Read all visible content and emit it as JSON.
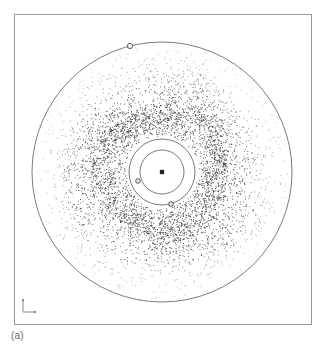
{
  "figure": {
    "caption": "(a)",
    "panel_label": "(a)",
    "background_color": "#ffffff",
    "frame": {
      "x": 14,
      "y": 14,
      "width": 298,
      "height": 311,
      "stroke_color": "#9a9a9a",
      "stroke_width": 1
    },
    "axis_indicator": {
      "name": "orientation-axes",
      "origin_x": 23,
      "origin_y": 312,
      "arm_length": 12,
      "stroke_color": "#8a8a8a",
      "tick_color": "#6a6a6a"
    }
  },
  "chart_data": {
    "type": "scatter",
    "title": "(a)",
    "subtitle": "",
    "xlabel": "",
    "ylabel": "",
    "grid": false,
    "legend_position": "none",
    "axis_ticks_visible": false,
    "center": {
      "x": 162,
      "y": 172
    },
    "xlim": [
      14,
      312
    ],
    "ylim": [
      14,
      325
    ],
    "point_color": "#3c3c3c",
    "point_count": 5200,
    "point_radius_px": 0.45,
    "radial_profile": {
      "inner_void_radius": 36,
      "ring_peak_radius": 68,
      "ring_half_width": 26,
      "outer_cutoff_radius": 132,
      "description": "annular particle disc, dense ring fading outward"
    },
    "circles": [
      {
        "name": "outer-boundary-circle",
        "radius": 130,
        "stroke_color": "#5a5a5a",
        "stroke_width": 0.8,
        "fill": "none"
      },
      {
        "name": "outer-orbit-circle",
        "radius": 33,
        "stroke_color": "#5a5a5a",
        "stroke_width": 0.8,
        "fill": "none"
      },
      {
        "name": "inner-orbit-circle",
        "radius": 22,
        "stroke_color": "#5a5a5a",
        "stroke_width": 0.8,
        "fill": "none"
      }
    ],
    "markers": [
      {
        "name": "outer-boundary-body",
        "x": 130,
        "y": 46,
        "radius": 2.6,
        "style": "open-circle",
        "stroke_color": "#4a4a4a",
        "fill": "#ffffff"
      },
      {
        "name": "inner-orbit-body",
        "x": 138,
        "y": 181,
        "radius": 2.3,
        "style": "open-circle",
        "stroke_color": "#4a4a4a",
        "fill": "#e8e8e8"
      },
      {
        "name": "outer-orbit-body",
        "x": 171,
        "y": 204,
        "radius": 2.3,
        "style": "open-circle",
        "stroke_color": "#4a4a4a",
        "fill": "#e8e8e8"
      },
      {
        "name": "central-body",
        "x": 162,
        "y": 172,
        "radius": 1.7,
        "style": "filled-square",
        "stroke_color": "#1a1a1a",
        "fill": "#1a1a1a"
      }
    ],
    "series": [
      {
        "name": "particle-disc",
        "values": []
      }
    ]
  }
}
